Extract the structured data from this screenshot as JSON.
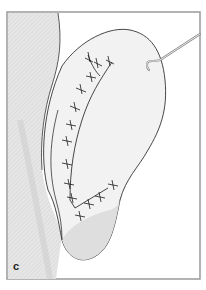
{
  "figure": {
    "panel_label": "c",
    "colors": {
      "frame": "#9a9a9a",
      "skin_light": "#f2f2f2",
      "skin_shade": "#dcdcdc",
      "skin_dark": "#c4c4c4",
      "outline": "#333333",
      "suture": "#1a1a1a",
      "hook": "#8a8a8a"
    }
  }
}
